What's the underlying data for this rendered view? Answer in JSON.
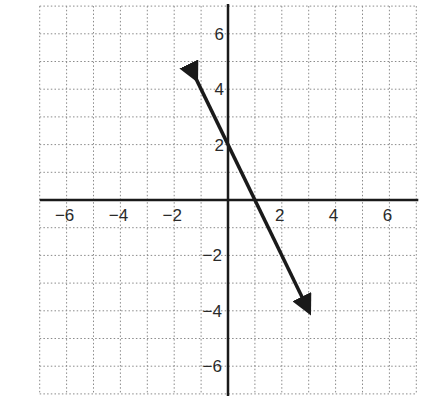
{
  "chart_data": {
    "type": "line",
    "title": "",
    "xlabel": "",
    "ylabel": "",
    "xlim": [
      -7,
      7
    ],
    "ylim": [
      -7,
      7
    ],
    "grid": true,
    "grid_style": "dotted",
    "x_ticks": [
      -6,
      -4,
      -2,
      2,
      4,
      6
    ],
    "y_ticks": [
      6,
      4,
      2,
      -2,
      -4,
      -6
    ],
    "x_tick_labels": [
      "−6",
      "−4",
      "−2",
      "2",
      "4",
      "6"
    ],
    "y_tick_labels": [
      "6",
      "4",
      "2",
      "−2",
      "−4",
      "−6"
    ],
    "series": [
      {
        "name": "line",
        "equation": "y = -2x + 2",
        "slope": -2,
        "y_intercept": 2,
        "x": [
          -1.2,
          3
        ],
        "y": [
          4.4,
          -4
        ],
        "arrows": "both",
        "color": "#1a1a1a"
      }
    ],
    "legend": null
  },
  "colors": {
    "axis": "#1a1a1a",
    "grid": "#8a8a8a",
    "line": "#1a1a1a",
    "text": "#2a2a2a"
  }
}
